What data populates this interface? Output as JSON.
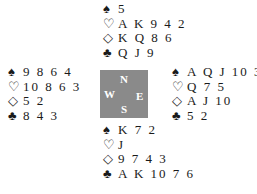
{
  "symbols": {
    "spades": "♠",
    "hearts": "♡",
    "diamonds": "◇",
    "clubs": "♣"
  },
  "compass": {
    "north": "N",
    "south": "S",
    "west": "W",
    "east": "E",
    "color": "#8a8a8a"
  },
  "hands": {
    "north": {
      "spades": "5",
      "hearts": "A K 9 4 2",
      "diamonds": "K Q 8 6",
      "clubs": "Q J 9"
    },
    "west": {
      "spades": "9 8 6 4",
      "hearts": "10 8 6 3",
      "diamonds": "5 2",
      "clubs": "8 4 3"
    },
    "east": {
      "spades": "A Q J 10 3",
      "hearts": "Q 7 5",
      "diamonds": "A J 10",
      "clubs": "5 2"
    },
    "south": {
      "spades": "K 7 2",
      "hearts": "J",
      "diamonds": "9 7 4 3",
      "clubs": "A K 10 7 6"
    }
  }
}
